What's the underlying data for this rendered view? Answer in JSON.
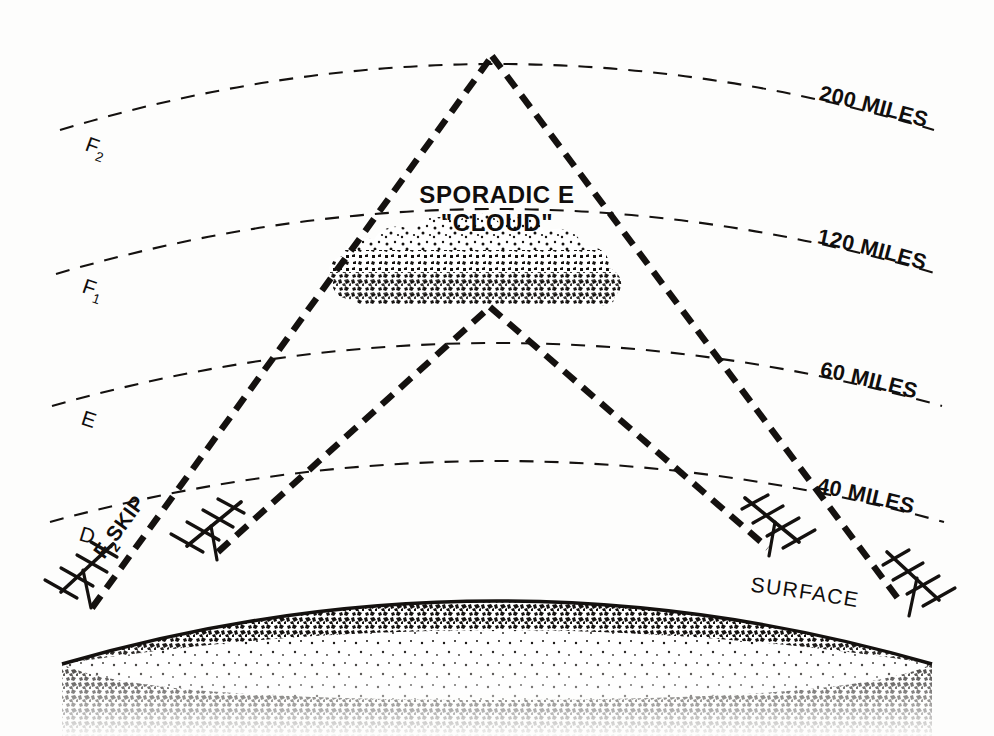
{
  "figure": {
    "background_color": "#fdfdfc",
    "ink_color": "#14110f"
  },
  "altitude_arcs": [
    {
      "id": "arc-200",
      "label": "200 MILES",
      "layer_name": "F2",
      "layer_text": "F",
      "layer_subscript": "2",
      "miles": 200
    },
    {
      "id": "arc-120",
      "label": "120 MILES",
      "layer_name": "F1",
      "layer_text": "F",
      "layer_subscript": "1",
      "miles": 120
    },
    {
      "id": "arc-60",
      "label": "60 MILES",
      "layer_name": "E",
      "layer_text": "E",
      "layer_subscript": "",
      "miles": 60
    },
    {
      "id": "arc-40",
      "label": "40 MILES",
      "layer_name": "D",
      "layer_text": "D",
      "layer_subscript": "",
      "miles": 40
    }
  ],
  "annotations": {
    "sporadic_cloud_line1": "SPORADIC E",
    "sporadic_cloud_line2": "\"CLOUD\"",
    "skip_path_text": "F",
    "skip_path_subscript": "2",
    "skip_path_suffix": " SKIP",
    "surface_label": "SURFACE"
  },
  "antennas": [
    {
      "id": "antenna-far-left",
      "side": "left",
      "role": "f2-skip-transmitter"
    },
    {
      "id": "antenna-inner-left",
      "side": "left",
      "role": "sporadic-e-transmitter"
    },
    {
      "id": "antenna-inner-right",
      "side": "right",
      "role": "sporadic-e-receiver"
    },
    {
      "id": "antenna-far-right",
      "side": "right",
      "role": "f2-skip-receiver"
    }
  ],
  "paths": [
    {
      "id": "f2-skip-path",
      "label": "F2 SKIP",
      "reflect_altitude_miles": 200
    },
    {
      "id": "sporadic-e-path",
      "label": "Sporadic E reflection",
      "reflect_altitude_miles": 120
    }
  ]
}
